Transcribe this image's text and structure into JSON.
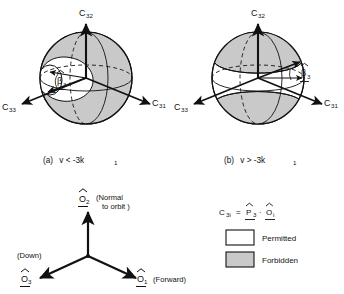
{
  "figure": {
    "panels": [
      {
        "id": "panel-a",
        "caption_label": "(a)",
        "caption_text": "v < -3k",
        "caption_sub": "1",
        "axes": [
          {
            "name": "c32",
            "base": "C",
            "sub": "32",
            "position": "up"
          },
          {
            "name": "c31",
            "base": "C",
            "sub": "31",
            "position": "right"
          },
          {
            "name": "c33",
            "base": "C",
            "sub": "33",
            "position": "left"
          }
        ],
        "angle_label": {
          "base": "β",
          "sub": "3",
          "hat": true
        },
        "region": "sphere with white permitted lobe, shaded forbidden remainder"
      },
      {
        "id": "panel-b",
        "caption_label": "(b)",
        "caption_text": "v > -3k",
        "caption_sub": "1",
        "axes": [
          {
            "name": "c32",
            "base": "C",
            "sub": "32",
            "position": "up"
          },
          {
            "name": "c31",
            "base": "C",
            "sub": "31",
            "position": "right"
          },
          {
            "name": "c33",
            "base": "C",
            "sub": "33",
            "position": "left"
          }
        ],
        "angle_label": {
          "base": "β",
          "sub": "3",
          "hat": true
        },
        "region": "sphere with shaded forbidden polar caps, white permitted band"
      }
    ],
    "frame": {
      "axes": [
        {
          "name": "o2",
          "base": "O",
          "sub": "2",
          "hat": true,
          "note_line1": "(Normal",
          "note_line2": "to orbit )",
          "direction": "up"
        },
        {
          "name": "o3",
          "base": "O",
          "sub": "3",
          "hat": true,
          "note_line1": "(Down)",
          "note_line2": "",
          "direction": "down-left"
        },
        {
          "name": "o1",
          "base": "O",
          "sub": "1",
          "hat": true,
          "note_line1": "(Forward)",
          "note_line2": "",
          "direction": "down-right"
        }
      ]
    },
    "legend": {
      "formula": {
        "lhs_base": "C",
        "lhs_sub": "3i",
        "equals": "=",
        "rhs1_base": "P",
        "rhs1_sub": "3",
        "dot": "·",
        "rhs2_base": "O",
        "rhs2_sub": "i"
      },
      "entries": [
        {
          "name": "permitted",
          "label": "Permitted",
          "swatch": "#ffffff"
        },
        {
          "name": "forbidden",
          "label": "Forbidden",
          "swatch": "#c9c9c9"
        }
      ]
    },
    "colors": {
      "line": "#111111",
      "shaded": "#c9c9c9",
      "permitted": "#ffffff",
      "background": "#ffffff"
    }
  }
}
